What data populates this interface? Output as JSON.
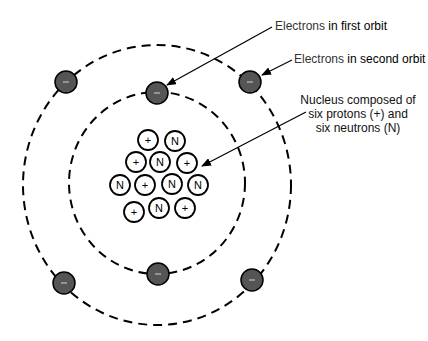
{
  "labels": {
    "first_orbit": {
      "part1": "Electrons",
      "part2": " in first orbit"
    },
    "second_orbit": {
      "part1": "Electrons",
      "part2": " in second orbit"
    },
    "nucleus": {
      "line1": "Nucleus composed of",
      "line2": "six protons (+) and",
      "line3": "six neutrons (N)"
    }
  },
  "colors": {
    "electron_fill": "#555555",
    "stroke": "#000000",
    "background": "#ffffff"
  },
  "orbits": [
    {
      "name": "first-orbit",
      "cx": 157,
      "cy": 183,
      "rx": 88,
      "ry": 91
    },
    {
      "name": "second-orbit",
      "cx": 157,
      "cy": 185,
      "rx": 134,
      "ry": 140
    }
  ],
  "electrons": [
    {
      "orbit": "first",
      "x": 157,
      "y": 93,
      "symbol": "−"
    },
    {
      "orbit": "first",
      "x": 158,
      "y": 274,
      "symbol": "−"
    },
    {
      "orbit": "second",
      "x": 66,
      "y": 82,
      "symbol": "−"
    },
    {
      "orbit": "second",
      "x": 250,
      "y": 82,
      "symbol": "−"
    },
    {
      "orbit": "second",
      "x": 64,
      "y": 283,
      "symbol": "−"
    },
    {
      "orbit": "second",
      "x": 252,
      "y": 280,
      "symbol": "−"
    }
  ],
  "nucleons": [
    {
      "type": "proton",
      "symbol": "+",
      "x": 148,
      "y": 140
    },
    {
      "type": "neutron",
      "symbol": "N",
      "x": 175,
      "y": 141
    },
    {
      "type": "proton",
      "symbol": "+",
      "x": 136,
      "y": 162
    },
    {
      "type": "neutron",
      "symbol": "N",
      "x": 160,
      "y": 162
    },
    {
      "type": "proton",
      "symbol": "+",
      "x": 187,
      "y": 163
    },
    {
      "type": "neutron",
      "symbol": "N",
      "x": 120,
      "y": 185
    },
    {
      "type": "proton",
      "symbol": "+",
      "x": 145,
      "y": 185
    },
    {
      "type": "neutron",
      "symbol": "N",
      "x": 172,
      "y": 184
    },
    {
      "type": "neutron",
      "symbol": "N",
      "x": 198,
      "y": 185
    },
    {
      "type": "proton",
      "symbol": "+",
      "x": 134,
      "y": 212
    },
    {
      "type": "neutron",
      "symbol": "N",
      "x": 159,
      "y": 208
    },
    {
      "type": "proton",
      "symbol": "+",
      "x": 185,
      "y": 208
    }
  ],
  "arrows": [
    {
      "name": "first-orbit-arrow",
      "x1": 272,
      "y1": 27,
      "x2": 167,
      "y2": 85
    },
    {
      "name": "second-orbit-arrow",
      "x1": 292,
      "y1": 60,
      "x2": 262,
      "y2": 75
    },
    {
      "name": "nucleus-arrow",
      "x1": 306,
      "y1": 112,
      "x2": 202,
      "y2": 166
    }
  ]
}
